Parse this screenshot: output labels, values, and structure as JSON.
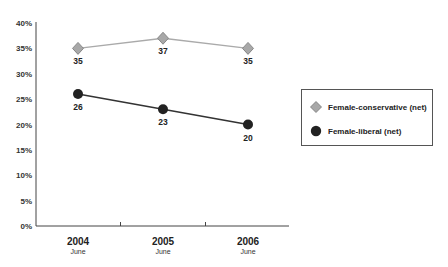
{
  "chart_data": {
    "type": "line",
    "title": "",
    "xlabel": "",
    "ylabel": "",
    "categories": [
      {
        "year": "2004",
        "sub": "June"
      },
      {
        "year": "2005",
        "sub": "June"
      },
      {
        "year": "2006",
        "sub": "June"
      }
    ],
    "ylim": [
      0,
      40
    ],
    "yticks": [
      0,
      5,
      10,
      15,
      20,
      25,
      30,
      35,
      40
    ],
    "ytick_labels": [
      "0%",
      "5%",
      "10%",
      "15%",
      "20%",
      "25%",
      "30%",
      "35%",
      "40%"
    ],
    "grid": false,
    "legend_position": "right",
    "series": [
      {
        "name": "Female-conservative (net)",
        "values": [
          35,
          37,
          35
        ],
        "labels": [
          "35",
          "37",
          "35"
        ],
        "marker": "diamond",
        "line_color": "#aaaaaa",
        "marker_color": "#999999"
      },
      {
        "name": "Female-liberal (net)",
        "values": [
          26,
          23,
          20
        ],
        "labels": [
          "26",
          "23",
          "20"
        ],
        "marker": "circle",
        "line_color": "#333333",
        "marker_color": "#222222"
      }
    ]
  }
}
